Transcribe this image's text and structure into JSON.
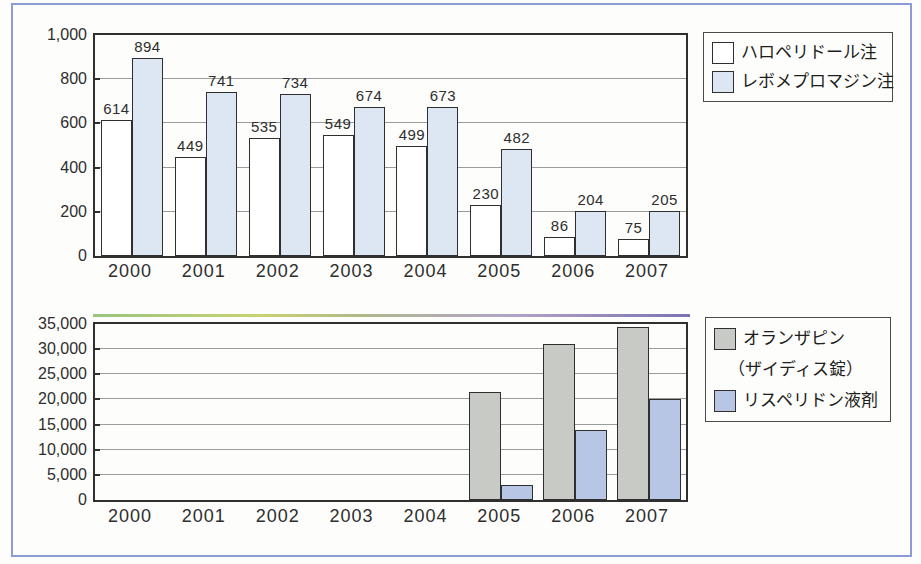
{
  "figure": {
    "frame_color": "#8a9bd6",
    "background": "#fdfdfb",
    "axis_color": "#2f2f2f",
    "gridline_color": "#9b9b9b"
  },
  "chart_data": [
    {
      "type": "bar",
      "title": "",
      "categories": [
        "2000",
        "2001",
        "2002",
        "2003",
        "2004",
        "2005",
        "2006",
        "2007"
      ],
      "series": [
        {
          "name": "ハロペリドール注",
          "color": "#ffffff",
          "values": [
            614,
            449,
            535,
            549,
            499,
            230,
            86,
            75
          ]
        },
        {
          "name": "レボメプロマジン注",
          "color": "#dce7f3",
          "values": [
            894,
            741,
            734,
            674,
            673,
            482,
            204,
            205
          ]
        }
      ],
      "ylim": [
        0,
        1000
      ],
      "ytick_step": 200,
      "yticks": [
        "0",
        "200",
        "400",
        "600",
        "800",
        "1,000"
      ],
      "value_labels": true,
      "grid": true,
      "legend_position": "top-right"
    },
    {
      "type": "bar",
      "title": "",
      "categories": [
        "2000",
        "2001",
        "2002",
        "2003",
        "2004",
        "2005",
        "2006",
        "2007"
      ],
      "series": [
        {
          "name": "オランザピン",
          "name_line2": "（ザイディス錠）",
          "color": "#c8cac5",
          "values": [
            null,
            null,
            null,
            null,
            null,
            21500,
            31000,
            34500
          ]
        },
        {
          "name": "リスペリドン液剤",
          "color": "#b6c6e4",
          "values": [
            null,
            null,
            null,
            null,
            null,
            3000,
            14000,
            20000
          ]
        }
      ],
      "ylim": [
        0,
        35000
      ],
      "ytick_step": 5000,
      "yticks": [
        "0",
        "5,000",
        "10,000",
        "15,000",
        "20,000",
        "25,000",
        "30,000",
        "35,000"
      ],
      "value_labels": false,
      "grid": true,
      "legend_position": "top-right"
    }
  ]
}
